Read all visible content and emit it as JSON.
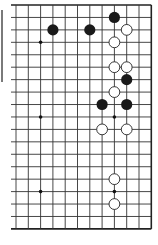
{
  "board": {
    "columns": 12,
    "rows": 19,
    "origin_x": 16,
    "origin_y": 5,
    "spacing_x": 12.3,
    "spacing_y": 12.44,
    "left_line_extension_x": 11,
    "line_color": "#333333",
    "border_color": "#222222",
    "star_points": [
      {
        "col": 2,
        "row": 3
      },
      {
        "col": 8,
        "row": 3
      },
      {
        "col": 2,
        "row": 9
      },
      {
        "col": 8,
        "row": 9
      },
      {
        "col": 2,
        "row": 15
      },
      {
        "col": 8,
        "row": 15
      }
    ]
  },
  "stones": [
    {
      "color": "black",
      "col": 8,
      "row": 1
    },
    {
      "color": "black",
      "col": 3,
      "row": 2
    },
    {
      "color": "black",
      "col": 6,
      "row": 2
    },
    {
      "color": "white",
      "col": 9,
      "row": 2
    },
    {
      "color": "white",
      "col": 8,
      "row": 3
    },
    {
      "color": "white",
      "col": 8,
      "row": 5
    },
    {
      "color": "white",
      "col": 9,
      "row": 5
    },
    {
      "color": "black",
      "col": 9,
      "row": 6
    },
    {
      "color": "white",
      "col": 8,
      "row": 7
    },
    {
      "color": "black",
      "col": 7,
      "row": 8
    },
    {
      "color": "black",
      "col": 9,
      "row": 8
    },
    {
      "color": "white",
      "col": 7,
      "row": 10
    },
    {
      "color": "white",
      "col": 9,
      "row": 10
    },
    {
      "color": "white",
      "col": 8,
      "row": 14
    },
    {
      "color": "white",
      "col": 8,
      "row": 16
    }
  ],
  "colors": {
    "black_stone": "#1a1a1a",
    "white_stone": "#ffffff",
    "white_stone_outline": "#222222",
    "background": "#ffffff"
  }
}
